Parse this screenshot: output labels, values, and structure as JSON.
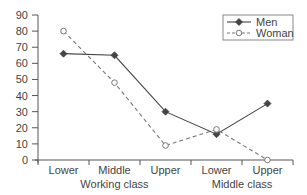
{
  "chart_data": {
    "type": "line",
    "title": "",
    "xlabel": "",
    "ylabel": "",
    "ylim": [
      0,
      90
    ],
    "yticks": [
      0,
      10,
      20,
      30,
      40,
      50,
      60,
      70,
      80,
      90
    ],
    "categories": [
      "Lower",
      "Middle",
      "Upper",
      "Lower",
      "Upper"
    ],
    "groups": [
      {
        "label": "Working class",
        "span": [
          0,
          2
        ]
      },
      {
        "label": "Middle class",
        "span": [
          3,
          4
        ]
      }
    ],
    "series": [
      {
        "name": "Men",
        "style": "solid",
        "marker": "filled-diamond",
        "values": [
          66,
          65,
          30,
          16,
          35
        ]
      },
      {
        "name": "Woman",
        "style": "dashed",
        "marker": "open-circle",
        "values": [
          80,
          48,
          9,
          19,
          0
        ]
      }
    ],
    "legend": {
      "position": "top-right",
      "entries": [
        "Men",
        "Woman"
      ]
    },
    "grid": false,
    "colors": {
      "axis": "#555555",
      "men": "#444444",
      "woman": "#777777",
      "text": "#444444"
    }
  }
}
